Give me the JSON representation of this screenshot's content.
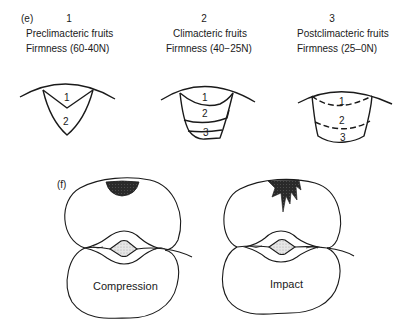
{
  "panel_e": {
    "label": "(e)",
    "stages": [
      {
        "number": "1",
        "name": "Preclimacteric fruits",
        "firmness": "Firmness (60-40N)",
        "layers": [
          "1",
          "2"
        ]
      },
      {
        "number": "2",
        "name": "Climacteric fruits",
        "firmness": "Firmness (40−25N)",
        "layers": [
          "1",
          "2",
          "3"
        ]
      },
      {
        "number": "3",
        "name": "Postclimacteric fruits",
        "firmness": "Firmness (25–0N)",
        "layers": [
          "1",
          "2",
          "3"
        ]
      }
    ]
  },
  "panel_f": {
    "label": "(f)",
    "diagrams": [
      {
        "caption": "Compression",
        "bruise_shape": "shallow-semicircle"
      },
      {
        "caption": "Impact",
        "bruise_shape": "spiked-star"
      }
    ]
  },
  "colors": {
    "line": "#1a1a1a",
    "bruise": "#2a2a2a",
    "core_stipple": "#d0d0d0"
  }
}
